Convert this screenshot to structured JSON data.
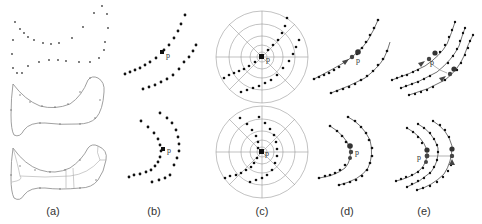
{
  "panels": [
    {
      "id": "a",
      "label": "(a)",
      "description": "Sampled contour points, traced outline, outline with medial/skeleton lines"
    },
    {
      "id": "b",
      "label": "(b)",
      "description": "Two curved dotted point sets with reference point p"
    },
    {
      "id": "c",
      "label": "(c)",
      "description": "Log-polar histogram bins centered at p over the point sets"
    },
    {
      "id": "d",
      "label": "(d)",
      "description": "Connected point chains with highlighted neighbors of p"
    },
    {
      "id": "e",
      "label": "(e)",
      "description": "Three connected chains with correspondences across curves near p"
    }
  ],
  "point_label": "p",
  "colors": {
    "dot": "#111111",
    "line": "#555555",
    "grid": "#aaaaaa",
    "outline": "#888888"
  }
}
